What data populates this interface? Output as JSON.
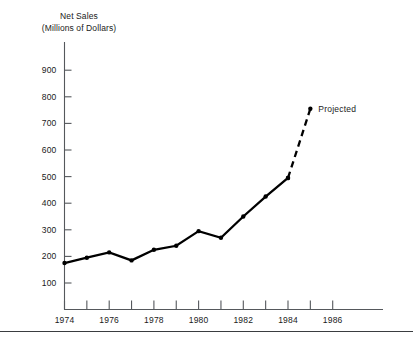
{
  "chart_data": {
    "type": "line",
    "title": "Net Sales",
    "subtitle": "(Millions of Dollars)",
    "xlabel": "",
    "ylabel": "Net Sales (Millions of Dollars)",
    "xlim": [
      1973.5,
      1986.5
    ],
    "ylim": [
      0,
      950
    ],
    "grid": false,
    "legend": false,
    "y_ticks": [
      100,
      200,
      300,
      400,
      500,
      600,
      700,
      800,
      900
    ],
    "y_tick_labels": [
      "100",
      "200",
      "300",
      "400",
      "500",
      "600",
      "700",
      "800",
      "900"
    ],
    "x_ticks": [
      1974,
      1975,
      1976,
      1977,
      1978,
      1979,
      1980,
      1981,
      1982,
      1983,
      1984,
      1985,
      1986
    ],
    "x_tick_labels": [
      "1974",
      "",
      "1976",
      "",
      "1978",
      "",
      "1980",
      "",
      "1982",
      "",
      "1984",
      "",
      "1986"
    ],
    "x_labeled_ticks": [
      1974,
      1976,
      1978,
      1980,
      1982,
      1984,
      1986
    ],
    "series": [
      {
        "name": "Net Sales (actual)",
        "style": "solid",
        "markers": true,
        "x": [
          1974,
          1975,
          1976,
          1977,
          1978,
          1979,
          1980,
          1981,
          1982,
          1983,
          1984
        ],
        "values": [
          175,
          195,
          215,
          185,
          225,
          240,
          295,
          270,
          350,
          425,
          495
        ]
      },
      {
        "name": "Net Sales (projected)",
        "style": "dashed",
        "markers": true,
        "x": [
          1984,
          1985
        ],
        "values": [
          495,
          755
        ]
      }
    ],
    "annotations": [
      {
        "text": "Projected",
        "x": 1985,
        "y": 755,
        "anchor": "start",
        "dx": 8,
        "dy": 3
      }
    ],
    "colors": {
      "series": "#000000",
      "axis": "#55585c",
      "text": "#1a1a1a",
      "background": "#ffffff"
    }
  }
}
